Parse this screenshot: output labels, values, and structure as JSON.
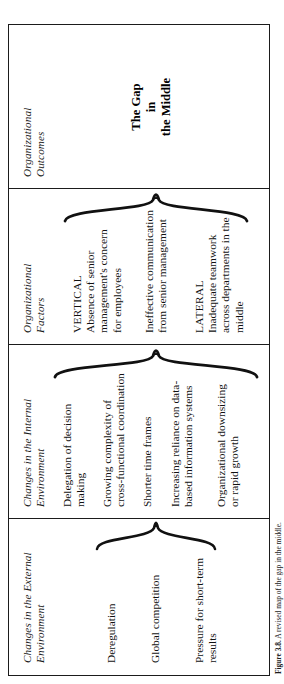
{
  "figure": {
    "caption_number": "Figure 3.8.",
    "caption_text": "A revised map of the gap in the middle."
  },
  "columns": [
    {
      "id": "external",
      "header": "Changes in the External\nEnvironment",
      "header_line1": "Changes in the External",
      "header_line2": "Environment",
      "items": [
        "Deregulation",
        "Global competition",
        "Pressure for short-term\nresults"
      ]
    },
    {
      "id": "internal",
      "header": "Changes in the Internal\nEnvironment",
      "header_line1": "Changes in the Internal",
      "header_line2": "Environment",
      "items": [
        "Delegation of decision\nmaking",
        "Growing complexity of\ncross-functional coordination",
        "Shorter time frames",
        "Increasing reliance on data-\nbased information systems",
        "Organizational downsizing\nor rapid growth"
      ]
    },
    {
      "id": "factors",
      "header": "Organizational\nFactors",
      "header_line1": "Organizational",
      "header_line2": "Factors",
      "items": [
        {
          "label": "VERTICAL",
          "text": "Absence of senior\nmanagement's concern\nfor employees"
        },
        {
          "label": "",
          "text": "Ineffective communication\nfrom senior management"
        },
        {
          "label": "LATERAL",
          "text": "Inadequate teamwork\nacross departments in the\nmiddle"
        }
      ]
    },
    {
      "id": "outcomes",
      "header": "Organizational\nOutcomes",
      "header_line1": "Organizational",
      "header_line2": "Outcomes",
      "items": [
        "The Gap\nin\nthe Middle"
      ],
      "gap_line1": "The Gap",
      "gap_line2": "in",
      "gap_line3": "the Middle"
    }
  ],
  "braces": [
    {
      "name": "brace-external-to-internal"
    },
    {
      "name": "brace-internal-to-factors"
    },
    {
      "name": "brace-factors-to-outcomes"
    }
  ],
  "colors": {
    "ink": "#1b1b1b",
    "paper": "#ffffff"
  }
}
